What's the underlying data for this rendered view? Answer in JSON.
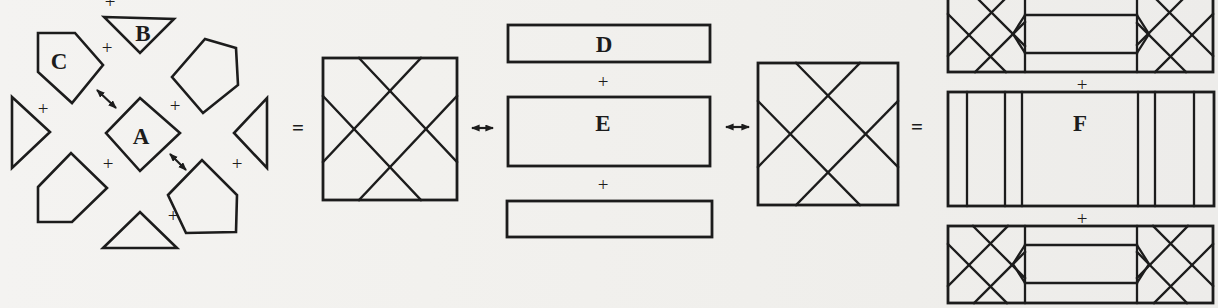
{
  "figure_type": "geometric dissection equivalence diagram (pieces = square ↔ strips ↔ square = strips)",
  "colors": {
    "ink": "#1c1c1c",
    "paper": "#f2f1ee"
  },
  "labels": {
    "piece_a": "A",
    "piece_b": "B",
    "piece_c": "C",
    "strip_d": "D",
    "strip_e": "E",
    "strip_f": "F"
  },
  "operators": {
    "plus": "+",
    "equals": "="
  },
  "icons": {
    "left_right_arrow": "↔",
    "diagonal_double_arrow": "⤢"
  }
}
